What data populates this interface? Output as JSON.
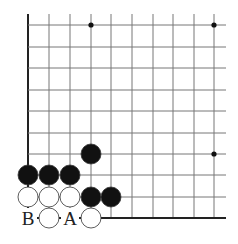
{
  "diagram": {
    "type": "go-board-fragment",
    "colors": {
      "line": "#777777",
      "edge": "#222222",
      "black_stone": "#111111",
      "white_stone": "#ffffff",
      "stone_outline": "#333333"
    },
    "grid": {
      "x_lines": [
        28,
        49,
        70,
        91,
        111,
        132,
        153,
        173,
        194,
        214
      ],
      "y_lines": [
        25,
        47,
        68,
        90,
        111,
        133,
        154,
        175,
        197,
        218
      ],
      "right_extent": 226,
      "top_extent": 14
    },
    "hoshi": [
      {
        "x": 91,
        "y": 25
      },
      {
        "x": 214,
        "y": 25
      },
      {
        "x": 214,
        "y": 154
      }
    ],
    "stones": [
      {
        "color": "black",
        "x": 91,
        "y": 154
      },
      {
        "color": "black",
        "x": 28,
        "y": 175
      },
      {
        "color": "black",
        "x": 49,
        "y": 175
      },
      {
        "color": "black",
        "x": 70,
        "y": 175
      },
      {
        "color": "white",
        "x": 28,
        "y": 197
      },
      {
        "color": "white",
        "x": 49,
        "y": 197
      },
      {
        "color": "white",
        "x": 70,
        "y": 197
      },
      {
        "color": "black",
        "x": 91,
        "y": 197
      },
      {
        "color": "black",
        "x": 111,
        "y": 197
      },
      {
        "color": "white",
        "x": 49,
        "y": 218
      },
      {
        "color": "white",
        "x": 91,
        "y": 218
      }
    ],
    "labels": [
      {
        "text": "B",
        "x": 28,
        "y": 218
      },
      {
        "text": "A",
        "x": 70,
        "y": 218
      }
    ]
  }
}
